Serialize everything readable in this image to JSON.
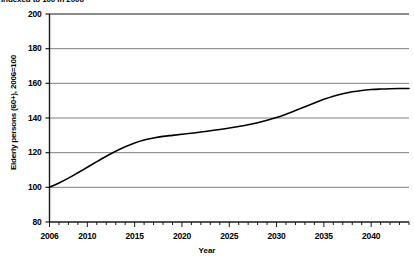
{
  "chart_data": {
    "type": "line",
    "title": "Indexed to 100 in 2006",
    "subtitle": "Indexed to 100 in 2006",
    "xlabel": "Year",
    "ylabel": "Elderly persons (60+), 2006=100",
    "xlim": [
      2006,
      2044
    ],
    "ylim": [
      80,
      200
    ],
    "yticks": [
      80,
      100,
      120,
      140,
      160,
      180,
      200
    ],
    "ytick_labels": [
      "80",
      "100",
      "120",
      "140",
      "160",
      "180",
      "200"
    ],
    "xticks": [
      2006,
      2010,
      2015,
      2020,
      2025,
      2030,
      2035,
      2040
    ],
    "xtick_labels": [
      "2006",
      "2010",
      "2015",
      "2020",
      "2025",
      "2030",
      "2035",
      "2040"
    ],
    "minor_xtick_interval": 1,
    "grid": "horizontal",
    "grid_color": "#808080",
    "line_color": "#000000",
    "legend": null,
    "x": [
      2006,
      2007,
      2008,
      2009,
      2010,
      2011,
      2012,
      2013,
      2014,
      2015,
      2016,
      2017,
      2018,
      2019,
      2020,
      2021,
      2022,
      2023,
      2024,
      2025,
      2026,
      2027,
      2028,
      2029,
      2030,
      2031,
      2032,
      2033,
      2034,
      2035,
      2036,
      2037,
      2038,
      2039,
      2040,
      2041,
      2042,
      2043,
      2044
    ],
    "values": [
      100.0,
      102.5,
      105.3,
      108.4,
      111.6,
      114.8,
      117.9,
      120.8,
      123.4,
      125.6,
      127.3,
      128.5,
      129.4,
      130.0,
      130.6,
      131.2,
      131.9,
      132.6,
      133.4,
      134.2,
      135.1,
      136.1,
      137.3,
      138.7,
      140.3,
      142.2,
      144.3,
      146.5,
      148.7,
      150.8,
      152.6,
      154.0,
      155.1,
      155.9,
      156.4,
      156.7,
      156.9,
      157.0,
      157.0
    ],
    "series": [
      {
        "name": "Elderly persons (60+)",
        "values": [
          100.0,
          102.5,
          105.3,
          108.4,
          111.6,
          114.8,
          117.9,
          120.8,
          123.4,
          125.6,
          127.3,
          128.5,
          129.4,
          130.0,
          130.6,
          131.2,
          131.9,
          132.6,
          133.4,
          134.2,
          135.1,
          136.1,
          137.3,
          138.7,
          140.3,
          142.2,
          144.3,
          146.5,
          148.7,
          150.8,
          152.6,
          154.0,
          155.1,
          155.9,
          156.4,
          156.7,
          156.9,
          157.0,
          157.0
        ]
      }
    ]
  }
}
